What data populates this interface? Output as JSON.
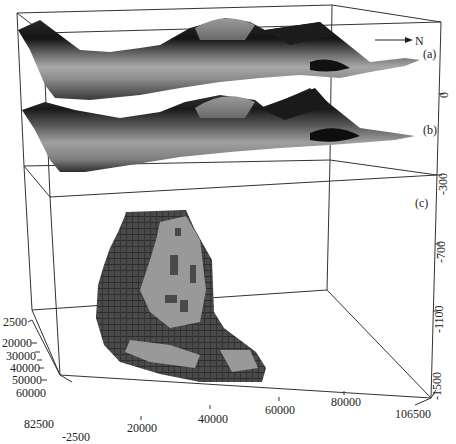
{
  "figure": {
    "north_arrow": {
      "label": "N",
      "icon": "arrow-right-icon"
    },
    "panels": [
      {
        "id": "a",
        "label": "(a)",
        "description": "upper shaded 3D surface"
      },
      {
        "id": "b",
        "label": "(b)",
        "description": "lower shaded 3D surface"
      },
      {
        "id": "c",
        "label": "(c)",
        "description": "3D voxel body"
      }
    ],
    "axes": {
      "vertical": {
        "ticks": [
          "0",
          "-300",
          "-700",
          "-1100",
          "-1500"
        ]
      },
      "x_front": {
        "ticks": [
          "-2500",
          "20000",
          "40000",
          "60000",
          "80000",
          "106500"
        ]
      },
      "y_depth": {
        "ticks": [
          "2500",
          "20000",
          "30000",
          "40000",
          "50000",
          "60000",
          "82500"
        ]
      }
    },
    "colors": {
      "line": "#333333",
      "surface_dark": "#1a1a1a",
      "surface_mid": "#7a7a7a",
      "surface_light": "#b8b8b8",
      "voxel_dark": "#4a4a4a",
      "voxel_light": "#9a9a9a"
    }
  }
}
